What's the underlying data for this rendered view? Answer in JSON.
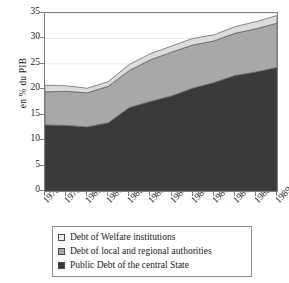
{
  "chart_data": {
    "type": "area",
    "stacked": true,
    "title": "",
    "xlabel": "",
    "ylabel": "en % du PIB",
    "ylim": [
      0,
      35
    ],
    "yticks": [
      0,
      5,
      10,
      15,
      20,
      25,
      30,
      35
    ],
    "grid": true,
    "grid_axis": "y",
    "legend_position": "below",
    "categories": [
      "1978",
      "1979",
      "1980",
      "1981",
      "1982",
      "1983",
      "1984",
      "1984",
      "1986",
      "1987",
      "1988",
      "1989"
    ],
    "series": [
      {
        "name": "Public Debt of the central State",
        "color": "#3a3a3a",
        "values": [
          13.0,
          12.9,
          12.6,
          13.4,
          16.4,
          17.6,
          18.7,
          20.2,
          21.3,
          22.7,
          23.4,
          24.3
        ]
      },
      {
        "name": "Debt of local and regional authorities",
        "color": "#a8a8a8",
        "values": [
          6.5,
          6.7,
          6.7,
          7.2,
          7.3,
          8.2,
          8.6,
          8.5,
          8.2,
          8.3,
          8.5,
          8.7
        ]
      },
      {
        "name": "Debt of Welfare institutions",
        "color": "#dcdcdc",
        "values": [
          1.3,
          1.1,
          0.9,
          0.9,
          1.2,
          1.2,
          1.2,
          1.3,
          1.2,
          1.3,
          1.4,
          1.5
        ]
      }
    ],
    "totals": [
      20.8,
      20.7,
      20.2,
      21.5,
      24.9,
      27.0,
      28.5,
      30.0,
      30.7,
      32.3,
      33.3,
      34.5
    ]
  },
  "legend": {
    "items": [
      {
        "label": "Debt of Welfare institutions",
        "color": "#ededed"
      },
      {
        "label": "Debt of local and regional authorities",
        "color": "#a8a8a8"
      },
      {
        "label": "Public Debt of the central State",
        "color": "#3a3a3a"
      }
    ]
  },
  "axis": {
    "frame_color": "#7d7d7d",
    "grid_color": "#e8e8e8"
  }
}
